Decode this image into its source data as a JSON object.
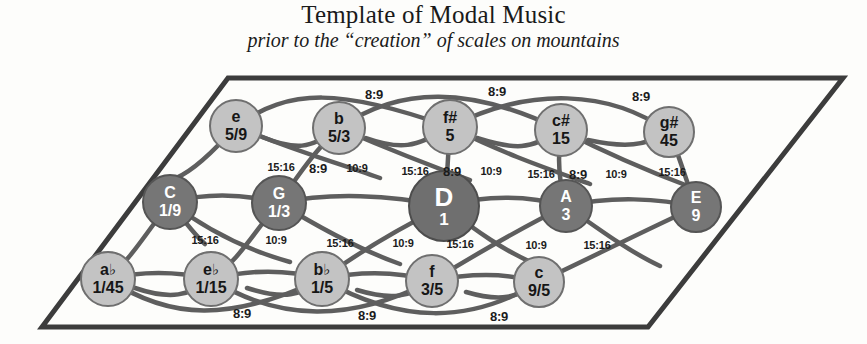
{
  "header": {
    "title": "Template of Modal Music",
    "subtitle": "prior to the “creation” of scales on mountains"
  },
  "colors": {
    "light_node": "#c3c3c3",
    "dark_node": "#767676",
    "center_node": "#6f6f6f",
    "edge": "#5e5e5e",
    "frame": "#3c3c3c",
    "text_dark": "#161616",
    "text_light": "#ffffff"
  },
  "diagram": {
    "type": "tonnetz-lattice",
    "frame_shape": "parallelogram",
    "rows": [
      {
        "name": "top-row",
        "shade": "light",
        "nodes": [
          {
            "label": "e",
            "ratio": "5/9",
            "cx": 236,
            "cy": 126,
            "r": 27
          },
          {
            "label": "b",
            "ratio": "5/3",
            "cx": 339,
            "cy": 128,
            "r": 27
          },
          {
            "label": "f#",
            "ratio": "5",
            "cx": 450,
            "cy": 127,
            "r": 28
          },
          {
            "label": "c#",
            "ratio": "15",
            "cx": 561,
            "cy": 130,
            "r": 27
          },
          {
            "label": "g#",
            "ratio": "45",
            "cx": 669,
            "cy": 132,
            "r": 26
          }
        ]
      },
      {
        "name": "middle-row",
        "shade": "dark",
        "nodes": [
          {
            "label": "C",
            "ratio": "1/9",
            "cx": 170,
            "cy": 202,
            "r": 28,
            "shade": "dark"
          },
          {
            "label": "G",
            "ratio": "1/3",
            "cx": 279,
            "cy": 203,
            "r": 28,
            "shade": "dark"
          },
          {
            "label": "D",
            "ratio": "1",
            "cx": 444,
            "cy": 206,
            "r": 36,
            "shade": "center"
          },
          {
            "label": "A",
            "ratio": "3",
            "cx": 566,
            "cy": 206,
            "r": 27,
            "shade": "dark"
          },
          {
            "label": "E",
            "ratio": "9",
            "cx": 696,
            "cy": 207,
            "r": 26,
            "shade": "dark"
          }
        ]
      },
      {
        "name": "bottom-row",
        "shade": "light",
        "nodes": [
          {
            "label": "a♭",
            "ratio": "1/45",
            "cx": 108,
            "cy": 279,
            "r": 28
          },
          {
            "label": "e♭",
            "ratio": "1/15",
            "cx": 211,
            "cy": 279,
            "r": 28
          },
          {
            "label": "b♭",
            "ratio": "1/5",
            "cx": 322,
            "cy": 279,
            "r": 28
          },
          {
            "label": "f",
            "ratio": "3/5",
            "cx": 432,
            "cy": 281,
            "r": 27
          },
          {
            "label": "c",
            "ratio": "9/5",
            "cx": 539,
            "cy": 282,
            "r": 26
          }
        ]
      }
    ],
    "edge_labels": [
      {
        "text": "8:9",
        "x": 374,
        "y": 94,
        "size": "big"
      },
      {
        "text": "8:9",
        "x": 497,
        "y": 91,
        "size": "big"
      },
      {
        "text": "8:9",
        "x": 641,
        "y": 96,
        "size": "big"
      },
      {
        "text": "15:16",
        "x": 281,
        "y": 167,
        "size": "small"
      },
      {
        "text": "8:9",
        "x": 318,
        "y": 168,
        "size": "big"
      },
      {
        "text": "10:9",
        "x": 357,
        "y": 168,
        "size": "small"
      },
      {
        "text": "15:16",
        "x": 415,
        "y": 171,
        "size": "small"
      },
      {
        "text": "8:9",
        "x": 452,
        "y": 171,
        "size": "big"
      },
      {
        "text": "10:9",
        "x": 491,
        "y": 171,
        "size": "small"
      },
      {
        "text": "15:16",
        "x": 541,
        "y": 174,
        "size": "small"
      },
      {
        "text": "8:9",
        "x": 578,
        "y": 174,
        "size": "big"
      },
      {
        "text": "10:9",
        "x": 616,
        "y": 174,
        "size": "small"
      },
      {
        "text": "15:16",
        "x": 672,
        "y": 172,
        "size": "small"
      },
      {
        "text": "15:16",
        "x": 205,
        "y": 240,
        "size": "small"
      },
      {
        "text": "10:9",
        "x": 276,
        "y": 240,
        "size": "small"
      },
      {
        "text": "15:16",
        "x": 340,
        "y": 243,
        "size": "small"
      },
      {
        "text": "10:9",
        "x": 403,
        "y": 243,
        "size": "small"
      },
      {
        "text": "15:16",
        "x": 460,
        "y": 244,
        "size": "small"
      },
      {
        "text": "10:9",
        "x": 536,
        "y": 245,
        "size": "small"
      },
      {
        "text": "15:16",
        "x": 597,
        "y": 245,
        "size": "small"
      },
      {
        "text": "8:9",
        "x": 242,
        "y": 313,
        "size": "big"
      },
      {
        "text": "8:9",
        "x": 367,
        "y": 315,
        "size": "big"
      },
      {
        "text": "8:9",
        "x": 499,
        "y": 316,
        "size": "big"
      }
    ]
  }
}
